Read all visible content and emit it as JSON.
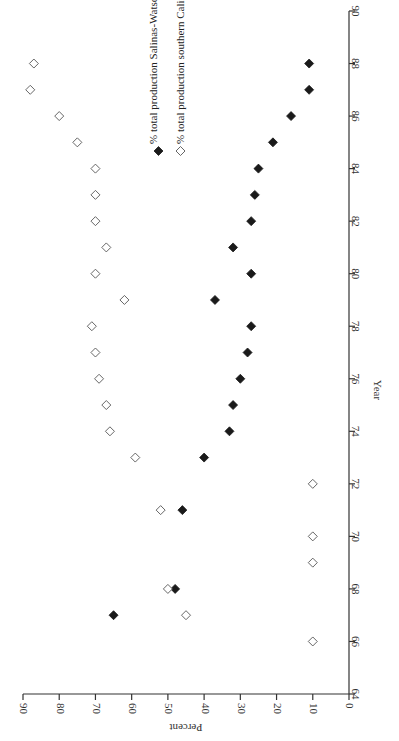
{
  "chart_data": {
    "type": "scatter",
    "orientation": "rotated 90 degrees clockwise (year axis vertical on right, percent axis horizontal on bottom, reading direction reversed)",
    "title": "",
    "xlabel": "Year",
    "ylabel": "Percent",
    "xlim": [
      64,
      90
    ],
    "ylim": [
      0,
      90
    ],
    "x_ticks": [
      "64",
      "66",
      "68",
      "70",
      "72",
      "74",
      "76",
      "78",
      "80",
      "82",
      "84",
      "86",
      "88",
      "90"
    ],
    "y_ticks": [
      "0",
      "10",
      "20",
      "30",
      "40",
      "50",
      "60",
      "70",
      "80",
      "90"
    ],
    "grid": false,
    "legend_position": "upper center (in rotated frame)",
    "series": [
      {
        "name": "% total production Salinas-Watsonville",
        "marker": "filled-diamond",
        "color": "#1a1a1a",
        "points": [
          {
            "x": 67,
            "y": 65
          },
          {
            "x": 68,
            "y": 48
          },
          {
            "x": 71,
            "y": 46
          },
          {
            "x": 73,
            "y": 40
          },
          {
            "x": 74,
            "y": 33
          },
          {
            "x": 75,
            "y": 32
          },
          {
            "x": 76,
            "y": 30
          },
          {
            "x": 77,
            "y": 28
          },
          {
            "x": 78,
            "y": 27
          },
          {
            "x": 79,
            "y": 37
          },
          {
            "x": 80,
            "y": 27
          },
          {
            "x": 81,
            "y": 32
          },
          {
            "x": 82,
            "y": 27
          },
          {
            "x": 83,
            "y": 26
          },
          {
            "x": 84,
            "y": 25
          },
          {
            "x": 85,
            "y": 21
          },
          {
            "x": 86,
            "y": 16
          },
          {
            "x": 87,
            "y": 11
          },
          {
            "x": 88,
            "y": 11
          }
        ]
      },
      {
        "name": "% total production southern California",
        "marker": "open-diamond",
        "color": "#555555",
        "points": [
          {
            "x": 66,
            "y": 10
          },
          {
            "x": 67,
            "y": 45
          },
          {
            "x": 68,
            "y": 50
          },
          {
            "x": 69,
            "y": 10
          },
          {
            "x": 70,
            "y": 10
          },
          {
            "x": 71,
            "y": 52
          },
          {
            "x": 72,
            "y": 10
          },
          {
            "x": 73,
            "y": 59
          },
          {
            "x": 74,
            "y": 66
          },
          {
            "x": 75,
            "y": 67
          },
          {
            "x": 76,
            "y": 69
          },
          {
            "x": 77,
            "y": 70
          },
          {
            "x": 78,
            "y": 71
          },
          {
            "x": 79,
            "y": 62
          },
          {
            "x": 80,
            "y": 70
          },
          {
            "x": 81,
            "y": 67
          },
          {
            "x": 82,
            "y": 70
          },
          {
            "x": 83,
            "y": 70
          },
          {
            "x": 84,
            "y": 70
          },
          {
            "x": 85,
            "y": 75
          },
          {
            "x": 86,
            "y": 80
          },
          {
            "x": 87,
            "y": 88
          },
          {
            "x": 88,
            "y": 87
          }
        ]
      }
    ]
  },
  "legend": {
    "items": [
      {
        "label": "% total production Salinas-Watsonville",
        "marker": "filled-diamond"
      },
      {
        "label": "% total production southern California",
        "marker": "open-diamond"
      }
    ]
  },
  "axes": {
    "year_title": "Year",
    "percent_title": "Percent"
  }
}
